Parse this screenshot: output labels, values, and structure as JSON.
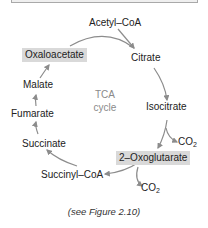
{
  "diagram": {
    "title_center": [
      "TCA",
      "cycle"
    ],
    "nodes": {
      "acetyl_coa": "Acetyl–CoA",
      "citrate": "Citrate",
      "isocitrate": "Isocitrate",
      "oxoglutarate": "2–Oxoglutarate",
      "succinyl_coa": "Succinyl–CoA",
      "succinate": "Succinate",
      "fumarate": "Fumarate",
      "malate": "Malate",
      "oxaloacetate": "Oxaloacetate"
    },
    "byproducts": {
      "co2_1": "CO",
      "co2_1_sub": "2",
      "co2_2": "CO",
      "co2_2_sub": "2"
    },
    "highlighted_nodes": [
      "Oxaloacetate",
      "2–Oxoglutarate"
    ],
    "colors": {
      "arrow": "#8c8c8c",
      "highlight": "#d9d9d9",
      "center_text": "#8a8a8a"
    }
  },
  "caption": "(see Figure 2.10)"
}
